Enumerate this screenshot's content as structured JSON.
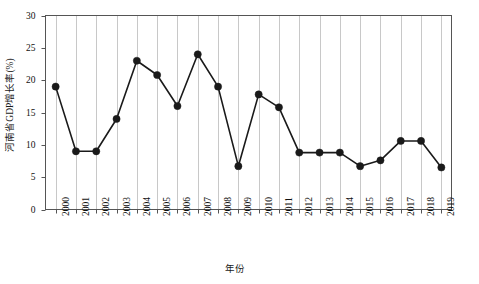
{
  "chart_data": {
    "type": "line",
    "title": "",
    "xlabel": "年份",
    "ylabel": "河南省GDP增长率(%)",
    "categories": [
      "2000",
      "2001",
      "2002",
      "2003",
      "2004",
      "2005",
      "2006",
      "2007",
      "2008",
      "2009",
      "2010",
      "2011",
      "2012",
      "2013",
      "2014",
      "2015",
      "2016",
      "2017",
      "2018",
      "2019"
    ],
    "values": [
      19.0,
      9.0,
      9.0,
      14.0,
      23.0,
      20.8,
      16.0,
      24.0,
      19.0,
      6.7,
      17.8,
      15.8,
      8.8,
      8.8,
      8.8,
      6.7,
      7.6,
      10.6,
      10.6,
      6.5
    ],
    "series": [
      {
        "name": "河南省GDP增长率(%)",
        "values": [
          19.0,
          9.0,
          9.0,
          14.0,
          23.0,
          20.8,
          16.0,
          24.0,
          19.0,
          6.7,
          17.8,
          15.8,
          8.8,
          8.8,
          8.8,
          6.7,
          7.6,
          10.6,
          10.6,
          6.5
        ]
      }
    ],
    "ylim": [
      0,
      30
    ],
    "yticks": [
      0,
      5,
      10,
      15,
      20,
      25,
      30
    ],
    "ytick_labels": [
      "0",
      "5",
      "10",
      "15",
      "20",
      "25",
      "30"
    ],
    "xtick_labels": [
      "2000",
      "2001",
      "2002",
      "2003",
      "2004",
      "2005",
      "2006",
      "2007",
      "2008",
      "2009",
      "2010",
      "2011",
      "2012",
      "2013",
      "2014",
      "2015",
      "2016",
      "2017",
      "2018",
      "2019"
    ],
    "grid": "vertical",
    "legend": "none",
    "marker": "filled-circle",
    "colors": {
      "line": "#1a1a1a",
      "marker": "#1a1a1a",
      "grid": "#c8c8c8",
      "axis": "#555555",
      "background": "#ffffff"
    }
  }
}
